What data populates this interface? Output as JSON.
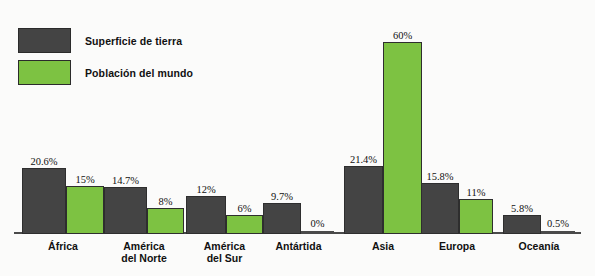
{
  "legend": {
    "items": [
      {
        "label": "Superficie de tierra",
        "color": "#444444",
        "swatch_name": "legend-swatch-land"
      },
      {
        "label": "Población del mundo",
        "color": "#7dc242",
        "swatch_name": "legend-swatch-population"
      }
    ]
  },
  "colors": {
    "land": "#444444",
    "population": "#7dc242",
    "background": "#fbfbfa",
    "axis": "#4a4a4a",
    "text": "#111111"
  },
  "chart_data": {
    "type": "bar",
    "title": "",
    "subtitle": "",
    "xlabel": "",
    "ylabel": "",
    "ylim": [
      0,
      60
    ],
    "grid": false,
    "legend_position": "top-left",
    "categories": [
      "África",
      "América\ndel Norte",
      "América\ndel Sur",
      "Antártida",
      "Asia",
      "Europa",
      "Oceanía"
    ],
    "series": [
      {
        "name": "Superficie de tierra",
        "color": "#444444",
        "values": [
          20.6,
          14.7,
          12,
          9.7,
          21.4,
          15.8,
          5.8
        ],
        "labels": [
          "20.6%",
          "14.7%",
          "12%",
          "9.7%",
          "21.4%",
          "15.8%",
          "5.8%"
        ]
      },
      {
        "name": "Población del mundo",
        "color": "#7dc242",
        "values": [
          15,
          8,
          6,
          0,
          60,
          11,
          0.5
        ],
        "labels": [
          "15%",
          "8%",
          "6%",
          "0%",
          "60%",
          "11%",
          "0.5%"
        ]
      }
    ]
  },
  "layout": {
    "groups": [
      {
        "left": 22,
        "dark_w": 44,
        "green_w": 38,
        "label_w": 82
      },
      {
        "left": 104,
        "dark_w": 43,
        "green_w": 37,
        "label_w": 80
      },
      {
        "left": 186,
        "dark_w": 40,
        "green_w": 37,
        "label_w": 77
      },
      {
        "left": 263,
        "dark_w": 38,
        "green_w": 33,
        "label_w": 71
      },
      {
        "left": 344,
        "dark_w": 39,
        "green_w": 39,
        "label_w": 78
      },
      {
        "left": 421,
        "dark_w": 38,
        "green_w": 34,
        "label_w": 72
      },
      {
        "left": 503,
        "dark_w": 38,
        "green_w": 34,
        "label_w": 72
      }
    ],
    "px_per_percent": 3.2,
    "zero_bar_height": 3
  }
}
